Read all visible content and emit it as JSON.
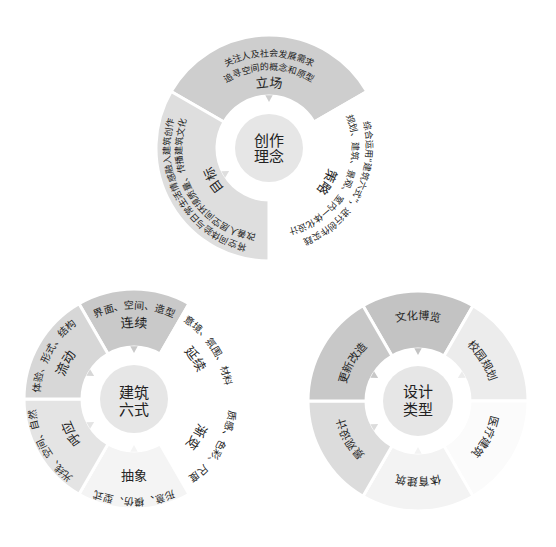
{
  "concept": {
    "center": {
      "line1": "创作",
      "line2": "理念"
    },
    "core_fill": "#e6e6e6",
    "segments": [
      {
        "label": "立场",
        "lines": [
          "关注人及社会发展需求",
          "追寻空间的概念和原型"
        ],
        "fill": "#cecece"
      },
      {
        "label": "策略",
        "lines": [
          "综合运用“建筑六式”，进行创作实践",
          "规划、建筑、景观、室内一体化设计"
        ],
        "fill": "#ffffff"
      },
      {
        "label": "目标",
        "lines": [
          "将空间体验与日常生活情感融入建筑创作",
          "改善人居空间环境质量、传播建筑文化"
        ],
        "fill": "#dedede"
      }
    ]
  },
  "six_forms": {
    "center": {
      "line1": "建筑",
      "line2": "六式"
    },
    "core_fill": "#e6e6e6",
    "segments": [
      {
        "label": "连续",
        "detail": "界面、空间、造型",
        "fill": "#c9c9c9"
      },
      {
        "label": "延续",
        "detail": "意境、氛围、材料",
        "fill": "#ffffff"
      },
      {
        "label": "渐变",
        "detail": "质感、色彩、尺度",
        "fill": "#ffffff"
      },
      {
        "label": "抽象",
        "detail": "形意、模仿、型式",
        "fill": "#f4f4f4"
      },
      {
        "label": "呼应",
        "detail": "光线、空间、自然",
        "fill": "#e4e4e4"
      },
      {
        "label": "流动",
        "detail": "体验、形式、结构",
        "fill": "#d7d7d7"
      }
    ]
  },
  "design_types": {
    "center": {
      "line1": "设计",
      "line2": "类型"
    },
    "core_fill": "#e6e6e6",
    "segments": [
      {
        "label": "文化博览",
        "fill": "#c3c3c3"
      },
      {
        "label": "校园规划",
        "fill": "#ececec"
      },
      {
        "label": "医疗建筑",
        "fill": "#fbfbfb"
      },
      {
        "label": "体育建筑",
        "fill": "#f3f3f3"
      },
      {
        "label": "景观设计",
        "fill": "#dcdcdc"
      },
      {
        "label": "更新改造",
        "fill": "#c8c8c8"
      }
    ]
  }
}
